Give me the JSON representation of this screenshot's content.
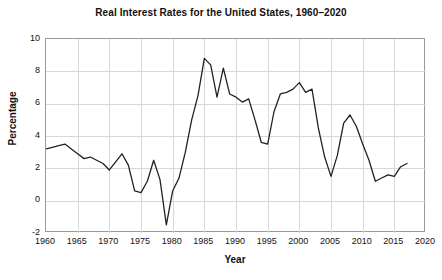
{
  "chart_data": {
    "type": "line",
    "title": "Real Interest Rates for the United States, 1960–2020",
    "xlabel": "Year",
    "ylabel": "Percentage",
    "xlim": [
      1960,
      2020
    ],
    "ylim": [
      -2,
      10
    ],
    "grid": true,
    "legend": null,
    "line_color": "#222222",
    "xticks": [
      1960,
      1965,
      1970,
      1975,
      1980,
      1985,
      1990,
      1995,
      2000,
      2005,
      2010,
      2015,
      2020
    ],
    "yticks": [
      -2,
      0,
      2,
      4,
      6,
      8,
      10
    ],
    "series": [
      {
        "name": "Real interest rate",
        "x": [
          1960,
          1961,
          1962,
          1963,
          1964,
          1965,
          1966,
          1967,
          1968,
          1969,
          1970,
          1971,
          1972,
          1973,
          1974,
          1975,
          1976,
          1977,
          1978,
          1979,
          1980,
          1981,
          1982,
          1983,
          1984,
          1985,
          1986,
          1987,
          1988,
          1989,
          1990,
          1991,
          1992,
          1993,
          1994,
          1995,
          1996,
          1997,
          1998,
          1999,
          2000,
          2001,
          2002,
          2003,
          2004,
          2005,
          2006,
          2007,
          2008,
          2009,
          2010,
          2011,
          2012,
          2013,
          2014,
          2015,
          2016,
          2017
        ],
        "y": [
          3.2,
          3.3,
          3.4,
          3.5,
          3.2,
          2.9,
          2.6,
          2.7,
          2.5,
          2.3,
          1.9,
          2.4,
          2.9,
          2.2,
          0.6,
          0.5,
          1.2,
          2.5,
          1.3,
          -1.5,
          0.6,
          1.4,
          3.0,
          5.0,
          6.5,
          8.8,
          8.4,
          6.4,
          8.2,
          6.6,
          6.4,
          6.1,
          6.3,
          5.0,
          3.6,
          3.5,
          5.5,
          6.6,
          6.7,
          6.9,
          7.3,
          6.7,
          6.9,
          4.5,
          2.7,
          1.5,
          2.8,
          4.8,
          5.3,
          4.6,
          3.5,
          2.5,
          1.2,
          1.4,
          1.6,
          1.5,
          2.1,
          2.3
        ]
      }
    ]
  },
  "axes": {
    "ytick_labels": [
      "10",
      "8",
      "6",
      "4",
      "2",
      "0",
      "-2"
    ],
    "xtick_labels": [
      "1960",
      "1965",
      "1970",
      "1975",
      "1980",
      "1985",
      "1990",
      "1995",
      "2000",
      "2005",
      "2010",
      "2015",
      "2020"
    ]
  },
  "colors": {
    "line": "#222222",
    "grid": "#d8d8d8",
    "border": "#9a9a9a",
    "text": "#111111",
    "background": "#ffffff"
  }
}
